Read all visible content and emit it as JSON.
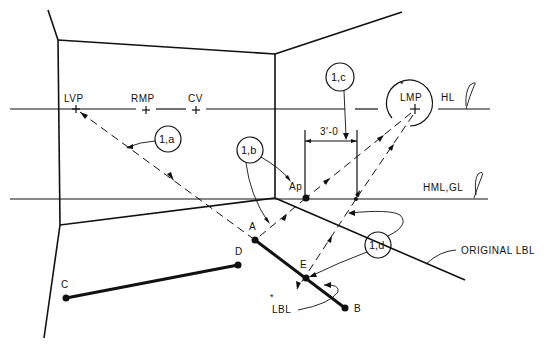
{
  "diagram": {
    "type": "perspective-construction",
    "colors": {
      "ink": "#111111",
      "background": "#ffffff"
    },
    "labels": {
      "lvp": "LVP",
      "rmp": "RMP",
      "cv": "CV",
      "lmp": "LMP",
      "hl": "HL",
      "hml_gl": "HML,GL",
      "dimension": "3'-0",
      "ap": "Ap",
      "a": "A",
      "b": "B",
      "c": "C",
      "d": "D",
      "e": "E",
      "lbl": "LBL",
      "original_lbl": "ORIGINAL LBL",
      "asterisk": "*"
    },
    "callouts": [
      {
        "id": "1a",
        "text": "1,a"
      },
      {
        "id": "1b",
        "text": "1,b"
      },
      {
        "id": "1c",
        "text": "1,c"
      },
      {
        "id": "1d",
        "text": "1,d"
      }
    ],
    "points": {
      "LVP": [
        76,
        109
      ],
      "RMP": [
        146,
        109
      ],
      "CV": [
        196,
        109
      ],
      "LMP": [
        415,
        109
      ],
      "Ap": [
        306,
        198
      ],
      "A": [
        255,
        240
      ],
      "E": [
        306,
        278
      ],
      "B": [
        345,
        308
      ],
      "C": [
        66,
        298
      ],
      "D": [
        238,
        265
      ]
    }
  }
}
